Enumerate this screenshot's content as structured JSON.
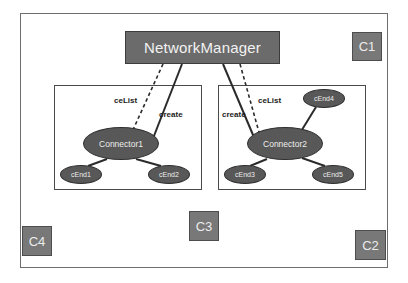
{
  "diagram": {
    "type": "uml-component-collaboration-diagram",
    "outer_frame": {
      "name": "system-boundary"
    },
    "manager": {
      "label": "NetworkManager",
      "fill": "#6b6b6b",
      "text_color": "#f2f2f2"
    },
    "components": [
      {
        "id": "left",
        "connector": {
          "label": "Connector1"
        },
        "ends": [
          {
            "label": "cEnd1"
          },
          {
            "label": "cEnd2"
          }
        ],
        "edges": [
          {
            "label": "ceList",
            "style": "dashed"
          },
          {
            "label": "create",
            "style": "solid"
          }
        ]
      },
      {
        "id": "right",
        "connector": {
          "label": "Connector2"
        },
        "ends": [
          {
            "label": "cEnd3"
          },
          {
            "label": "cEnd4"
          },
          {
            "label": "cEnd5"
          }
        ],
        "edges": [
          {
            "label": "create",
            "style": "solid"
          },
          {
            "label": "ceList",
            "style": "dashed"
          }
        ]
      }
    ],
    "corner_labels": [
      {
        "id": "c1",
        "label": "C1"
      },
      {
        "id": "c2",
        "label": "C2"
      },
      {
        "id": "c3",
        "label": "C3"
      },
      {
        "id": "c4",
        "label": "C4"
      }
    ],
    "colors": {
      "node_fill": "#585858",
      "node_text": "#ededed",
      "corner_fill": "#787878",
      "frame_stroke": "#6e6e6e",
      "edge_stroke": "#2b2b2b"
    }
  }
}
